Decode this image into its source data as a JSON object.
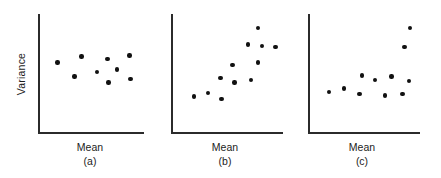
{
  "figure": {
    "ylabel": "Variance",
    "accent_color": "#111111",
    "axis_color": "#2b2b2b"
  },
  "chart_data": [
    {
      "type": "scatter",
      "title": "",
      "xlabel": "Mean",
      "ylabel": "Variance",
      "tag": "(a)",
      "grid": false,
      "legend": "none",
      "xlim": [
        0,
        100
      ],
      "ylim": [
        0,
        100
      ],
      "description": "Variance roughly constant as mean increases",
      "points": [
        {
          "x": 17,
          "y": 59
        },
        {
          "x": 40,
          "y": 64
        },
        {
          "x": 65,
          "y": 62
        },
        {
          "x": 86,
          "y": 65
        },
        {
          "x": 33,
          "y": 47
        },
        {
          "x": 55,
          "y": 51
        },
        {
          "x": 74,
          "y": 53
        },
        {
          "x": 66,
          "y": 42
        },
        {
          "x": 87,
          "y": 45
        }
      ]
    },
    {
      "type": "scatter",
      "title": "",
      "xlabel": "Mean",
      "ylabel": "Variance",
      "tag": "(b)",
      "grid": false,
      "legend": "none",
      "xlim": [
        0,
        100
      ],
      "ylim": [
        0,
        100
      ],
      "description": "Variance increases with the mean",
      "points": [
        {
          "x": 77,
          "y": 88
        },
        {
          "x": 68,
          "y": 74
        },
        {
          "x": 81,
          "y": 73
        },
        {
          "x": 93,
          "y": 72
        },
        {
          "x": 54,
          "y": 57
        },
        {
          "x": 77,
          "y": 59
        },
        {
          "x": 43,
          "y": 46
        },
        {
          "x": 56,
          "y": 42
        },
        {
          "x": 71,
          "y": 44
        },
        {
          "x": 19,
          "y": 30
        },
        {
          "x": 32,
          "y": 33
        },
        {
          "x": 44,
          "y": 28
        }
      ]
    },
    {
      "type": "scatter",
      "title": "",
      "xlabel": "Mean",
      "ylabel": "Variance",
      "tag": "(c)",
      "grid": false,
      "legend": "none",
      "xlim": [
        0,
        100
      ],
      "ylim": [
        0,
        100
      ],
      "description": "Variance constant except for two outlying high values",
      "points": [
        {
          "x": 91,
          "y": 88
        },
        {
          "x": 86,
          "y": 72
        },
        {
          "x": 47,
          "y": 48
        },
        {
          "x": 59,
          "y": 44
        },
        {
          "x": 74,
          "y": 47
        },
        {
          "x": 90,
          "y": 43
        },
        {
          "x": 17,
          "y": 34
        },
        {
          "x": 31,
          "y": 37
        },
        {
          "x": 45,
          "y": 32
        },
        {
          "x": 68,
          "y": 31
        },
        {
          "x": 84,
          "y": 32
        }
      ]
    }
  ]
}
